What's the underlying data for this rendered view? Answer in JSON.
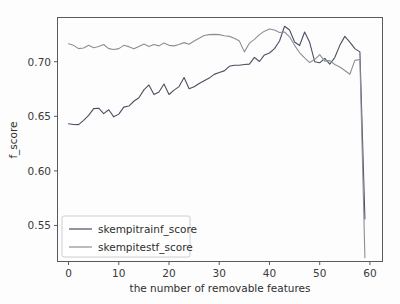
{
  "chart_data": {
    "type": "line",
    "title": "",
    "xlabel": "the  number of removable features",
    "ylabel": "f_score",
    "xlim": [
      -2.2,
      62.5
    ],
    "ylim": [
      0.517,
      0.7405
    ],
    "xticks": [
      0,
      10,
      20,
      30,
      40,
      50,
      60
    ],
    "xticklabels": [
      "0",
      "10",
      "20",
      "30",
      "40",
      "50",
      "60"
    ],
    "yticks": [
      0.55,
      0.6,
      0.65,
      0.7
    ],
    "yticklabels": [
      "0.55",
      "0.60",
      "0.65",
      "0.70"
    ],
    "grid": false,
    "legend_position": "lower left",
    "x": [
      0,
      1,
      2,
      3,
      4,
      5,
      6,
      7,
      8,
      9,
      10,
      11,
      12,
      13,
      14,
      15,
      16,
      17,
      18,
      19,
      20,
      21,
      22,
      23,
      24,
      25,
      26,
      27,
      28,
      29,
      30,
      31,
      32,
      33,
      34,
      35,
      36,
      37,
      38,
      39,
      40,
      41,
      42,
      43,
      44,
      45,
      46,
      47,
      48,
      49,
      50,
      51,
      52,
      53,
      54,
      55,
      56,
      57,
      58,
      59
    ],
    "series": [
      {
        "name": "skempitrainf_score",
        "color": "#4a4f63",
        "values": [
          0.6432,
          0.6425,
          0.6424,
          0.6462,
          0.6508,
          0.657,
          0.6574,
          0.6525,
          0.656,
          0.6495,
          0.652,
          0.6584,
          0.6594,
          0.6638,
          0.667,
          0.6742,
          0.6787,
          0.67,
          0.6722,
          0.6796,
          0.67,
          0.674,
          0.6772,
          0.6856,
          0.6752,
          0.677,
          0.68,
          0.6826,
          0.685,
          0.6884,
          0.6902,
          0.6916,
          0.6958,
          0.6968,
          0.6968,
          0.6975,
          0.6978,
          0.704,
          0.7002,
          0.7062,
          0.708,
          0.712,
          0.719,
          0.7325,
          0.729,
          0.718,
          0.7148,
          0.7272,
          0.7178,
          0.7,
          0.699,
          0.703,
          0.6978,
          0.7038,
          0.715,
          0.7232,
          0.718,
          0.712,
          0.709,
          0.556
        ]
      },
      {
        "name": "skempitestf_score",
        "color": "#8c8f96",
        "values": [
          0.7165,
          0.715,
          0.712,
          0.7125,
          0.715,
          0.7128,
          0.714,
          0.7158,
          0.712,
          0.7112,
          0.712,
          0.715,
          0.7138,
          0.7118,
          0.714,
          0.7162,
          0.714,
          0.7158,
          0.7145,
          0.7172,
          0.715,
          0.7145,
          0.7158,
          0.7175,
          0.716,
          0.719,
          0.7215,
          0.724,
          0.7248,
          0.725,
          0.7248,
          0.7238,
          0.7232,
          0.7215,
          0.719,
          0.709,
          0.717,
          0.7205,
          0.7248,
          0.728,
          0.73,
          0.729,
          0.7268,
          0.7272,
          0.7228,
          0.715,
          0.7082,
          0.7035,
          0.6992,
          0.702,
          0.7065,
          0.7005,
          0.701,
          0.6975,
          0.6952,
          0.692,
          0.6885,
          0.7012,
          0.702,
          0.5205
        ]
      }
    ],
    "legend_entries": [
      {
        "label": "skempitrainf_score",
        "color": "#4a4f63"
      },
      {
        "label": "skempitestf_score",
        "color": "#8c8f96"
      }
    ]
  }
}
